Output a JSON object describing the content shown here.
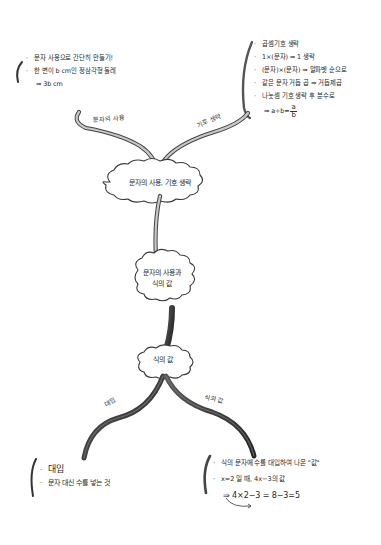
{
  "mindmap": {
    "center": {
      "label_line1": "문자의 사용과",
      "label_line2": "식의 값"
    },
    "top_node": {
      "label": "문자의 사용, 기호 생략",
      "branches": [
        {
          "label": "문자의 사용",
          "notes": [
            {
              "bullet": "·",
              "text": "문자 사용으로 간단히 만들기!"
            },
            {
              "bullet": "·",
              "text": "한 변이 b cm인 정삼각형 둘레"
            },
            {
              "bullet": "",
              "text": "⇒ 3b cm"
            }
          ]
        },
        {
          "label": "기호 생략",
          "notes": [
            {
              "bullet": "·",
              "text": "곱셈기호 생략"
            },
            {
              "bullet": "·",
              "text": "1×(문자) ⇒ 1 생략"
            },
            {
              "bullet": "·",
              "text": "(문자)×(문자) ⇒ 알파벳 순으로"
            },
            {
              "bullet": "·",
              "text": "같은 문자 거듭 곱 ⇒ 거듭제곱"
            },
            {
              "bullet": "·",
              "text": "나눗셈 기호 생략 후 분수로"
            },
            {
              "bullet": "",
              "text_prefix": "⇒ a÷b=",
              "frac_num": "a",
              "frac_den": "b"
            }
          ]
        }
      ]
    },
    "bottom_node": {
      "label": "식의 값",
      "branches": [
        {
          "label": "대입",
          "notes": [
            {
              "bullet": "·",
              "text": "대입"
            },
            {
              "bullet": "·",
              "text": "문자 대신 수를 넣는 것"
            }
          ]
        },
        {
          "label": "식의 값",
          "notes": [
            {
              "bullet": "·",
              "text": "식의 문자에 수를 대입하여 나온 \"값\""
            },
            {
              "bullet": "·",
              "text": "x=2 일 때, 4x−3의 값"
            },
            {
              "bullet": "",
              "text": "⇒ 4×2−3 = 8−3=5"
            }
          ]
        }
      ]
    },
    "colors": {
      "ink": "#2a2a2a",
      "branch_light": "#bdbdbd",
      "branch_dark": "#3a3a3a",
      "background": "#ffffff"
    }
  }
}
